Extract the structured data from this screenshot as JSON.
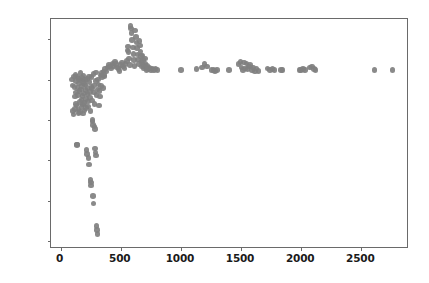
{
  "figure": {
    "width": 429,
    "height": 283,
    "background": "#ffffff",
    "marker_color": "#808080",
    "spine_color": "#6a6a6a",
    "tick_label_color": "#1a1a1a"
  },
  "chart_data": {
    "type": "scatter",
    "title": "",
    "xlabel": "",
    "ylabel": "",
    "xlim": [
      -80,
      2880
    ],
    "ylim": [
      349.3,
      377.5
    ],
    "grid": false,
    "legend": null,
    "xticks": [
      0,
      500,
      1000,
      1500,
      2000,
      2500
    ],
    "xtick_labels": [
      "0",
      "500",
      "1000",
      "1500",
      "2000",
      "2500"
    ],
    "yticks": [
      350,
      355,
      360,
      365,
      370,
      375
    ],
    "ytick_labels": [
      "350",
      "355",
      "360",
      "365",
      "370",
      "375"
    ],
    "series": [
      {
        "name": "series-1",
        "marker": "o",
        "color": "#808080",
        "points": [
          [
            95,
            370.0
          ],
          [
            100,
            369.3
          ],
          [
            105,
            366.1
          ],
          [
            108,
            365.7
          ],
          [
            112,
            370.4
          ],
          [
            115,
            369.1
          ],
          [
            118,
            367.9
          ],
          [
            120,
            366.4
          ],
          [
            124,
            370.6
          ],
          [
            126,
            368.4
          ],
          [
            128,
            367.0
          ],
          [
            130,
            369.8
          ],
          [
            132,
            366.8
          ],
          [
            134,
            362.0
          ],
          [
            137,
            361.9
          ],
          [
            140,
            370.3
          ],
          [
            142,
            369.0
          ],
          [
            145,
            368.1
          ],
          [
            147,
            366.3
          ],
          [
            150,
            365.9
          ],
          [
            152,
            370.1
          ],
          [
            155,
            369.5
          ],
          [
            158,
            368.6
          ],
          [
            160,
            367.2
          ],
          [
            163,
            366.0
          ],
          [
            165,
            370.8
          ],
          [
            168,
            369.9
          ],
          [
            170,
            368.8
          ],
          [
            172,
            367.5
          ],
          [
            175,
            366.6
          ],
          [
            178,
            370.2
          ],
          [
            180,
            369.2
          ],
          [
            182,
            368.0
          ],
          [
            185,
            366.9
          ],
          [
            188,
            365.8
          ],
          [
            190,
            370.5
          ],
          [
            193,
            369.6
          ],
          [
            195,
            368.3
          ],
          [
            198,
            367.1
          ],
          [
            200,
            366.2
          ],
          [
            203,
            370.0
          ],
          [
            205,
            369.4
          ],
          [
            208,
            368.7
          ],
          [
            210,
            367.6
          ],
          [
            212,
            366.5
          ],
          [
            215,
            361.3
          ],
          [
            218,
            360.8
          ],
          [
            220,
            370.1
          ],
          [
            222,
            369.0
          ],
          [
            225,
            368.2
          ],
          [
            228,
            367.3
          ],
          [
            230,
            366.7
          ],
          [
            232,
            360.3
          ],
          [
            235,
            359.5
          ],
          [
            238,
            370.4
          ],
          [
            240,
            369.7
          ],
          [
            242,
            368.5
          ],
          [
            245,
            367.8
          ],
          [
            248,
            366.1
          ],
          [
            250,
            357.6
          ],
          [
            252,
            357.3
          ],
          [
            255,
            356.9
          ],
          [
            256,
            370.3
          ],
          [
            258,
            369.1
          ],
          [
            260,
            368.9
          ],
          [
            262,
            367.4
          ],
          [
            264,
            365.0
          ],
          [
            266,
            364.8
          ],
          [
            268,
            364.4
          ],
          [
            270,
            355.6
          ],
          [
            272,
            354.7
          ],
          [
            274,
            370.7
          ],
          [
            276,
            369.3
          ],
          [
            278,
            368.4
          ],
          [
            280,
            367.0
          ],
          [
            282,
            364.2
          ],
          [
            285,
            363.9
          ],
          [
            288,
            361.5
          ],
          [
            290,
            361.0
          ],
          [
            292,
            360.6
          ],
          [
            294,
            370.9
          ],
          [
            296,
            369.8
          ],
          [
            298,
            368.1
          ],
          [
            300,
            351.9
          ],
          [
            302,
            351.4
          ],
          [
            305,
            350.9
          ],
          [
            308,
            368.8
          ],
          [
            312,
            370.0
          ],
          [
            315,
            369.4
          ],
          [
            318,
            366.8
          ],
          [
            322,
            368.6
          ],
          [
            326,
            367.9
          ],
          [
            330,
            370.5
          ],
          [
            335,
            369.2
          ],
          [
            340,
            370.8
          ],
          [
            345,
            370.3
          ],
          [
            350,
            369.0
          ],
          [
            355,
            371.0
          ],
          [
            360,
            370.6
          ],
          [
            365,
            370.4
          ],
          [
            370,
            371.3
          ],
          [
            380,
            371.0
          ],
          [
            390,
            371.5
          ],
          [
            400,
            371.8
          ],
          [
            410,
            371.6
          ],
          [
            420,
            371.4
          ],
          [
            430,
            372.0
          ],
          [
            440,
            371.7
          ],
          [
            450,
            372.2
          ],
          [
            460,
            371.9
          ],
          [
            470,
            371.5
          ],
          [
            480,
            371.3
          ],
          [
            490,
            371.1
          ],
          [
            500,
            371.8
          ],
          [
            510,
            372.1
          ],
          [
            520,
            371.6
          ],
          [
            530,
            371.4
          ],
          [
            540,
            371.9
          ],
          [
            550,
            372.3
          ],
          [
            555,
            373.6
          ],
          [
            560,
            374.1
          ],
          [
            565,
            373.4
          ],
          [
            570,
            372.6
          ],
          [
            575,
            371.8
          ],
          [
            580,
            376.6
          ],
          [
            585,
            376.3
          ],
          [
            590,
            375.8
          ],
          [
            595,
            374.9
          ],
          [
            600,
            374.0
          ],
          [
            605,
            373.2
          ],
          [
            610,
            372.4
          ],
          [
            615,
            371.7
          ],
          [
            620,
            376.1
          ],
          [
            625,
            375.3
          ],
          [
            630,
            374.6
          ],
          [
            635,
            373.9
          ],
          [
            640,
            373.1
          ],
          [
            645,
            372.5
          ],
          [
            650,
            371.9
          ],
          [
            655,
            374.8
          ],
          [
            660,
            374.2
          ],
          [
            665,
            373.5
          ],
          [
            668,
            372.9
          ],
          [
            672,
            372.2
          ],
          [
            676,
            371.6
          ],
          [
            680,
            373.0
          ],
          [
            685,
            372.4
          ],
          [
            690,
            371.8
          ],
          [
            695,
            371.4
          ],
          [
            700,
            372.6
          ],
          [
            705,
            372.0
          ],
          [
            710,
            371.5
          ],
          [
            715,
            371.2
          ],
          [
            720,
            371.7
          ],
          [
            730,
            371.3
          ],
          [
            740,
            371.5
          ],
          [
            750,
            371.2
          ],
          [
            760,
            371.4
          ],
          [
            775,
            371.2
          ],
          [
            790,
            371.3
          ],
          [
            805,
            371.2
          ],
          [
            1000,
            371.2
          ],
          [
            1130,
            371.3
          ],
          [
            1175,
            371.5
          ],
          [
            1195,
            371.9
          ],
          [
            1215,
            371.6
          ],
          [
            1255,
            371.2
          ],
          [
            1270,
            371.2
          ],
          [
            1285,
            371.1
          ],
          [
            1300,
            371.2
          ],
          [
            1400,
            371.2
          ],
          [
            1480,
            371.9
          ],
          [
            1495,
            372.2
          ],
          [
            1505,
            371.5
          ],
          [
            1515,
            371.2
          ],
          [
            1525,
            372.1
          ],
          [
            1535,
            371.4
          ],
          [
            1545,
            372.0
          ],
          [
            1555,
            371.3
          ],
          [
            1565,
            371.6
          ],
          [
            1575,
            371.8
          ],
          [
            1590,
            371.2
          ],
          [
            1600,
            371.5
          ],
          [
            1615,
            371.0
          ],
          [
            1630,
            371.4
          ],
          [
            1645,
            371.1
          ],
          [
            1720,
            371.4
          ],
          [
            1740,
            371.2
          ],
          [
            1760,
            371.3
          ],
          [
            1780,
            371.2
          ],
          [
            1830,
            371.2
          ],
          [
            1845,
            371.2
          ],
          [
            1985,
            371.2
          ],
          [
            2000,
            371.2
          ],
          [
            2015,
            371.3
          ],
          [
            2030,
            371.2
          ],
          [
            2075,
            371.5
          ],
          [
            2090,
            371.6
          ],
          [
            2105,
            371.3
          ],
          [
            2120,
            371.2
          ],
          [
            2610,
            371.2
          ],
          [
            2760,
            371.2
          ]
        ]
      }
    ]
  }
}
